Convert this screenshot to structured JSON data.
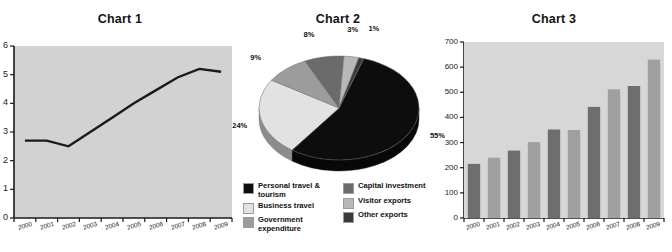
{
  "panels": [
    {
      "title": "Chart 1"
    },
    {
      "title": "Chart 2"
    },
    {
      "title": "Chart 3"
    }
  ],
  "chart_data": [
    {
      "type": "line",
      "title": "Chart 1",
      "xlabel": "",
      "ylabel": "",
      "grid": false,
      "legend": "none",
      "plot_background": "#d2d2d2",
      "line_color": "#1a1a1a",
      "x": [
        "2000",
        "2001",
        "2002",
        "2003",
        "2004",
        "2005",
        "2006",
        "2007",
        "2008",
        "2009"
      ],
      "categories": [
        "2000",
        "2001",
        "2002",
        "2003",
        "2004",
        "2005",
        "2006",
        "2007",
        "2008",
        "2009"
      ],
      "values": [
        2.7,
        2.7,
        2.5,
        3.0,
        3.5,
        4.0,
        4.45,
        4.9,
        5.2,
        5.1
      ],
      "yticks": [
        "0",
        "1",
        "2",
        "3",
        "4",
        "5",
        "6"
      ],
      "ylim": [
        0,
        6
      ],
      "xtick_labels": [
        "2000",
        "2001",
        "2002",
        "2003",
        "2004",
        "2005",
        "2006",
        "2007",
        "2008",
        "2009"
      ]
    },
    {
      "type": "pie",
      "title": "Chart 2",
      "legend": "bottom",
      "labels": [
        "Personal travel & tourism",
        "Business travel",
        "Government expenditure",
        "Capital investment",
        "Visitor exports",
        "Other exports"
      ],
      "values": [
        55,
        24,
        9,
        8,
        3,
        1
      ],
      "data_labels": [
        "55%",
        "24%",
        "9%",
        "8%",
        "3%",
        "1%"
      ],
      "colors": [
        "#0d0d0d",
        "#e2e2e2",
        "#9c9c9c",
        "#6b6b6b",
        "#b8b8b8",
        "#3a3a3a"
      ],
      "legend_entries": [
        {
          "label": "Personal travel & tourism",
          "color": "#0d0d0d"
        },
        {
          "label": "Business travel",
          "color": "#e2e2e2"
        },
        {
          "label": "Government expenditure",
          "color": "#9c9c9c"
        },
        {
          "label": "Capital investment",
          "color": "#6b6b6b"
        },
        {
          "label": "Visitor exports",
          "color": "#b8b8b8"
        },
        {
          "label": "Other exports",
          "color": "#3a3a3a"
        }
      ]
    },
    {
      "type": "bar",
      "title": "Chart 3",
      "xlabel": "",
      "ylabel": "",
      "grid": false,
      "legend": "none",
      "plot_background": "#d7d7d7",
      "categories": [
        "2000",
        "2001",
        "2002",
        "2003",
        "2004",
        "2005",
        "2006",
        "2007",
        "2008",
        "2009"
      ],
      "values": [
        215,
        240,
        268,
        302,
        352,
        350,
        442,
        512,
        525,
        630
      ],
      "bar_colors": [
        "#6e6e6e",
        "#a0a0a0",
        "#6e6e6e",
        "#a0a0a0",
        "#6e6e6e",
        "#a0a0a0",
        "#6e6e6e",
        "#a0a0a0",
        "#6e6e6e",
        "#a0a0a0"
      ],
      "yticks": [
        "0",
        "100",
        "200",
        "300",
        "400",
        "500",
        "600",
        "700"
      ],
      "ylim": [
        0,
        700
      ],
      "xtick_labels": [
        "2000",
        "2001",
        "2002",
        "2003",
        "2004",
        "2005",
        "2006",
        "2007",
        "2008",
        "2009"
      ]
    }
  ]
}
